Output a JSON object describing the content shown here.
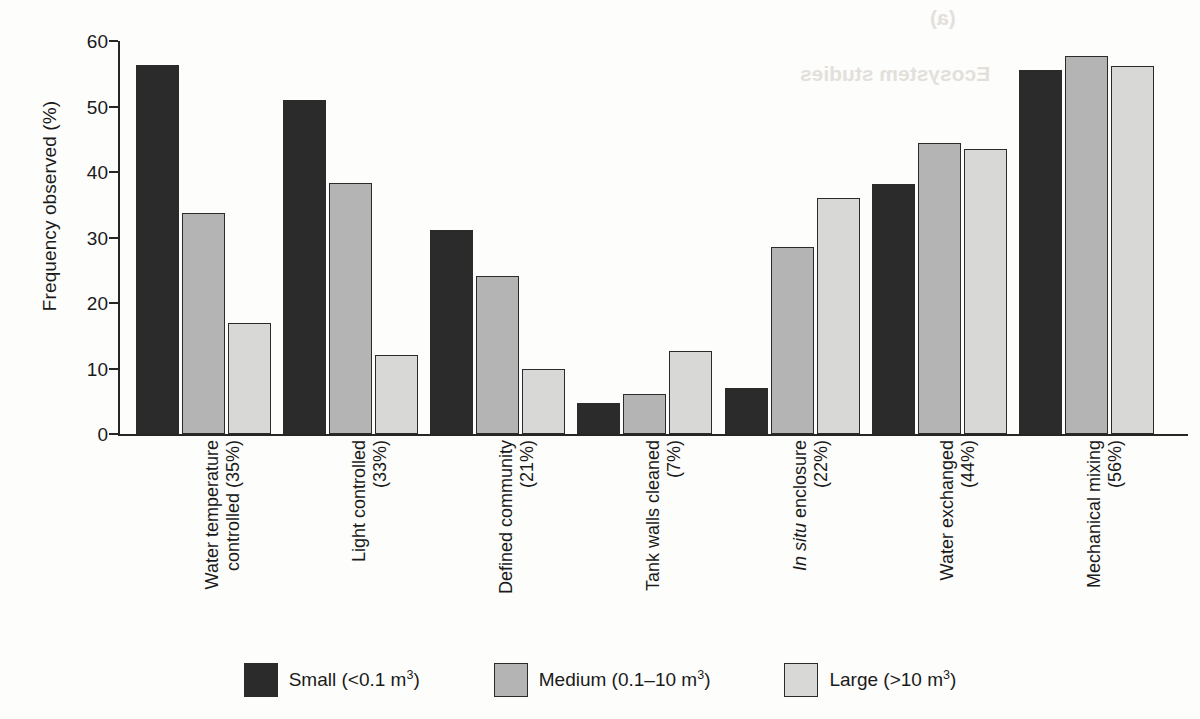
{
  "chart_data": {
    "type": "bar",
    "title": "",
    "xlabel": "",
    "ylabel": "Frequency observed (%)",
    "ylim": [
      0,
      60
    ],
    "yticks": [
      0,
      10,
      20,
      30,
      40,
      50,
      60
    ],
    "ytick_labels": [
      "0",
      "10",
      "20",
      "30",
      "40",
      "50",
      "60"
    ],
    "grid": false,
    "legend_position": "bottom-center",
    "grouping": "grouped",
    "categories": [
      "Water temperature controlled (35%)",
      "Light controlled (33%)",
      "Defined community (21%)",
      "Tank walls cleaned (7%)",
      "In situ enclosure (22%)",
      "Water exchanged (44%)",
      "Mechanical mixing (56%)"
    ],
    "category_lines": [
      [
        "Water temperature",
        "controlled (35%)"
      ],
      [
        "Light controlled",
        "(33%)"
      ],
      [
        "Defined community",
        "(21%)"
      ],
      [
        "Tank walls cleaned",
        "(7%)"
      ],
      [
        "In situ enclosure",
        "(22%)"
      ],
      [
        "Water exchanged",
        "(44%)"
      ],
      [
        "Mechanical mixing",
        "(56%)"
      ]
    ],
    "category_italic_prefix": [
      "",
      "",
      "",
      "",
      "In situ",
      "",
      ""
    ],
    "series": [
      {
        "name": "Small (<0.1 m3)",
        "key": "small",
        "color": "#2b2b2b",
        "values": [
          56.3,
          51.0,
          31.1,
          4.8,
          7.0,
          38.1,
          55.6
        ]
      },
      {
        "name": "Medium (0.1-10 m3)",
        "key": "medium",
        "color": "#b4b4b4",
        "values": [
          33.8,
          38.3,
          24.2,
          6.1,
          28.6,
          44.4,
          57.7
        ]
      },
      {
        "name": "Large (>10 m3)",
        "key": "large",
        "color": "#d8d8d6",
        "values": [
          17.0,
          12.0,
          10.0,
          12.7,
          36.1,
          43.5,
          56.2
        ]
      }
    ],
    "legend": [
      {
        "label_prefix": "Small (<0.1 m",
        "sup": "3",
        "label_suffix": ")",
        "swatch": "#2b2b2b"
      },
      {
        "label_prefix": "Medium (0.1–10 m",
        "sup": "3",
        "label_suffix": ")",
        "swatch": "#b4b4b4"
      },
      {
        "label_prefix": "Large (>10 m",
        "sup": "3",
        "label_suffix": ")",
        "swatch": "#d8d8d6"
      }
    ]
  },
  "axes": {
    "y_title": "Frequency observed (%)"
  },
  "artifacts": {
    "bleed_panel_label": "(a)",
    "bleed_title": "Ecosystem studies"
  },
  "colors": {
    "axis": "#262626",
    "small": "#2b2b2b",
    "medium": "#b4b4b4",
    "large": "#d8d8d6",
    "background": "#fdfdfb"
  }
}
